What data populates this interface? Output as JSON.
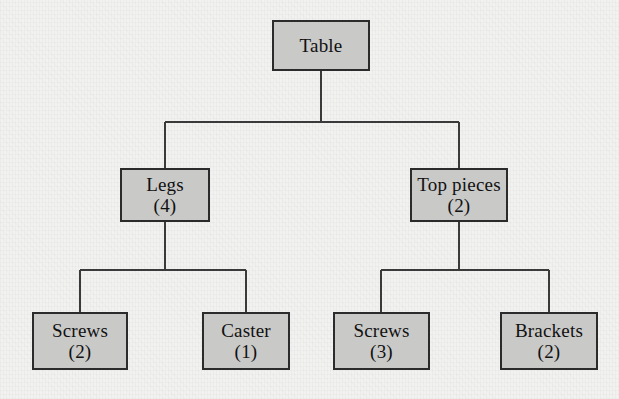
{
  "diagram": {
    "type": "product-structure-tree",
    "colors": {
      "box_fill": "#c9c9c8",
      "box_border": "#2b2b2b",
      "line": "#3a3a3a",
      "text": "#111111",
      "background": "#f2f2f1"
    },
    "nodes": [
      {
        "id": "table",
        "label": "Table",
        "quantity": "",
        "level": 0,
        "x": 272,
        "y": 20,
        "w": 98,
        "h": 51
      },
      {
        "id": "legs",
        "label": "Legs",
        "quantity": "(4)",
        "level": 1,
        "x": 120,
        "y": 168,
        "w": 90,
        "h": 54
      },
      {
        "id": "top-pieces",
        "label": "Top pieces",
        "quantity": "(2)",
        "level": 1,
        "x": 410,
        "y": 168,
        "w": 98,
        "h": 54
      },
      {
        "id": "screws-legs",
        "label": "Screws",
        "quantity": "(2)",
        "level": 2,
        "x": 32,
        "y": 312,
        "w": 96,
        "h": 58
      },
      {
        "id": "caster",
        "label": "Caster",
        "quantity": "(1)",
        "level": 2,
        "x": 202,
        "y": 312,
        "w": 88,
        "h": 58
      },
      {
        "id": "screws-top",
        "label": "Screws",
        "quantity": "(3)",
        "level": 2,
        "x": 333,
        "y": 312,
        "w": 97,
        "h": 58
      },
      {
        "id": "brackets",
        "label": "Brackets",
        "quantity": "(2)",
        "level": 2,
        "x": 500,
        "y": 312,
        "w": 98,
        "h": 58
      }
    ],
    "edges": [
      {
        "from": "table",
        "to": "legs"
      },
      {
        "from": "table",
        "to": "top-pieces"
      },
      {
        "from": "legs",
        "to": "screws-legs"
      },
      {
        "from": "legs",
        "to": "caster"
      },
      {
        "from": "top-pieces",
        "to": "screws-top"
      },
      {
        "from": "top-pieces",
        "to": "brackets"
      }
    ]
  }
}
